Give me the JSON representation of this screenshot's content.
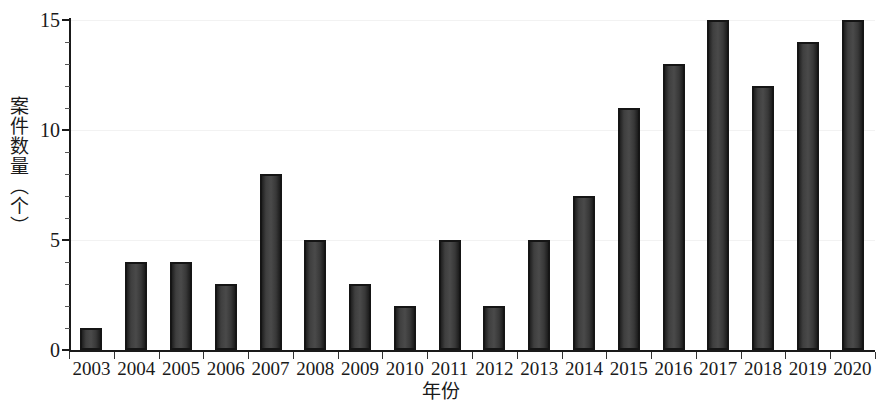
{
  "chart_data": {
    "type": "bar",
    "title": "",
    "subtitle": "",
    "xlabel": "年份",
    "ylabel": "案件数量（个）",
    "categories": [
      "2003",
      "2004",
      "2005",
      "2006",
      "2007",
      "2008",
      "2009",
      "2010",
      "2011",
      "2012",
      "2013",
      "2014",
      "2015",
      "2016",
      "2017",
      "2018",
      "2019",
      "2020"
    ],
    "values": [
      1,
      4,
      4,
      3,
      8,
      5,
      3,
      2,
      5,
      2,
      5,
      7,
      11,
      13,
      15,
      12,
      14,
      15
    ],
    "ylim": [
      0,
      15
    ],
    "xlim_note": "categorical",
    "y_ticks_major": [
      0,
      5,
      10,
      15
    ],
    "y_tick_labels": [
      "0",
      "5",
      "10",
      "15"
    ],
    "y_ticks_minor": [
      1,
      2,
      3,
      4,
      6,
      7,
      8,
      9,
      11,
      12,
      13,
      14
    ],
    "grid": "horizontal-faint",
    "legend": "none",
    "legend_position": "none",
    "bar_color": "#3a3a3a",
    "bar_edge_color": "#151515",
    "axis_color": "#1a1a1a",
    "background_color": "#ffffff",
    "gridline_color": "#f2f2f2"
  },
  "axes": {
    "y_title": "案件数量（个）",
    "x_title": "年份"
  }
}
